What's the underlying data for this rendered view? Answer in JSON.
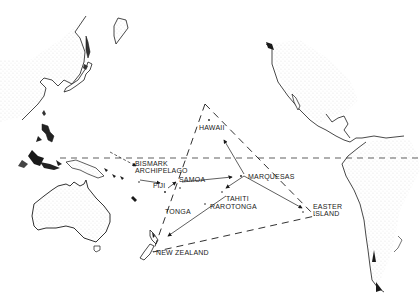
{
  "map": {
    "title": "Polynesian Triangle",
    "colors": {
      "ink": "#1a1a1a",
      "land_fill": "#f2f2f2",
      "background": "#ffffff"
    },
    "labels": [
      {
        "id": "hawaii",
        "text": "HAWAII",
        "x": 199,
        "y": 128
      },
      {
        "id": "bismark",
        "text": "BISMARK",
        "x": 135,
        "y": 160
      },
      {
        "id": "archipelago",
        "text": "ARCHIPELAGO",
        "x": 135,
        "y": 167
      },
      {
        "id": "samoa",
        "text": "SAMOA",
        "x": 179,
        "y": 177
      },
      {
        "id": "fiji",
        "text": "FIJI",
        "x": 152,
        "y": 182
      },
      {
        "id": "marquesas",
        "text": "MARQUESAS",
        "x": 248,
        "y": 173
      },
      {
        "id": "tahiti",
        "text": "TAHITI",
        "x": 225,
        "y": 195
      },
      {
        "id": "rarotonga",
        "text": "RAROTONGA",
        "x": 209,
        "y": 203
      },
      {
        "id": "tonga",
        "text": "TONGA",
        "x": 165,
        "y": 209
      },
      {
        "id": "easter",
        "text": "EASTER",
        "x": 313,
        "y": 204
      },
      {
        "id": "island",
        "text": "ISLAND",
        "x": 313,
        "y": 211
      },
      {
        "id": "new-zealand",
        "text": "NEW ZEALAND",
        "x": 156,
        "y": 250
      }
    ],
    "triangle": {
      "apex_hawaii": [
        205,
        104
      ],
      "easter_island": [
        315,
        216
      ],
      "new_zealand": [
        153,
        252
      ]
    },
    "equator_y": 158
  }
}
